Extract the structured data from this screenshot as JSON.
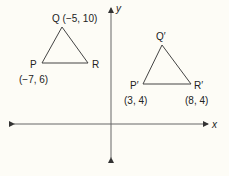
{
  "axes": {
    "x_label": "x",
    "y_label": "y",
    "color": "#555555"
  },
  "triangles": [
    {
      "name": "PQR",
      "vertices": [
        {
          "id": "P",
          "label": "P",
          "coord": "(−7, 6)",
          "px": [
            42,
            63
          ]
        },
        {
          "id": "Q",
          "label": "Q",
          "coord": "(−5, 10)",
          "px": [
            62,
            27
          ]
        },
        {
          "id": "R",
          "label": "R",
          "coord": "",
          "px": [
            88,
            63
          ]
        }
      ]
    },
    {
      "name": "P'Q'R'",
      "vertices": [
        {
          "id": "P'",
          "label": "P′",
          "coord": "(3, 4)",
          "px": [
            143,
            84
          ]
        },
        {
          "id": "Q'",
          "label": "Q′",
          "coord": "",
          "px": [
            162,
            45
          ]
        },
        {
          "id": "R'",
          "label": "R′",
          "coord": "(8, 4)",
          "px": [
            191,
            84
          ]
        }
      ]
    }
  ],
  "labels": {
    "Q": "Q (−5, 10)",
    "P": "P",
    "P_coord": "(−7, 6)",
    "R": "R",
    "Qp": "Q′",
    "Pp": "P′",
    "Pp_coord": "(3, 4)",
    "Rp": "R′",
    "Rp_coord": "(8, 4)"
  }
}
